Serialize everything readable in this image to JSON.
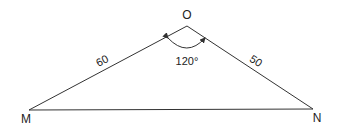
{
  "diagram": {
    "type": "triangle",
    "vertices": [
      {
        "label": "O",
        "x": 187,
        "y": 26
      },
      {
        "label": "M",
        "x": 29,
        "y": 110
      },
      {
        "label": "N",
        "x": 313,
        "y": 109
      }
    ],
    "sides": [
      {
        "from": "O",
        "to": "M",
        "label": "60"
      },
      {
        "from": "O",
        "to": "N",
        "label": "50"
      },
      {
        "from": "M",
        "to": "N",
        "label": ""
      }
    ],
    "angle": {
      "vertex": "O",
      "label": "120°"
    },
    "stroke_color": "#333333"
  }
}
